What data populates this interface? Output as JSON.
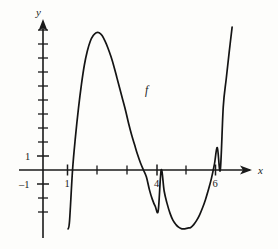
{
  "figure": {
    "background_color": "#fdfdfb",
    "curve_color": "#141414",
    "axis_color": "#1a1a1a"
  },
  "labels": {
    "y_axis_name": "y",
    "x_axis_name": "x",
    "curve_name": "f",
    "y_tick_pos_one": "1",
    "y_tick_neg_one": "–1",
    "x_tick_one": "1",
    "x_tick_four": "4",
    "x_tick_six": "6"
  },
  "chart_data": {
    "type": "line",
    "title": "",
    "xlabel": "x",
    "ylabel": "y",
    "series": [
      {
        "name": "f",
        "x": [
          0.85,
          0.9,
          1.0,
          1.1,
          1.2,
          1.3,
          1.4,
          1.5,
          1.6,
          1.7,
          1.8,
          1.9,
          2.0,
          2.1,
          2.2,
          2.3,
          2.4,
          2.5,
          2.6,
          2.7,
          2.8,
          2.9,
          3.0,
          3.1,
          3.2,
          3.3,
          3.4,
          3.5,
          3.6,
          3.7,
          3.8,
          3.9,
          4.0,
          4.1,
          4.2,
          4.3,
          4.4,
          4.5,
          4.6,
          4.7,
          4.8,
          4.9,
          5.0,
          5.1,
          5.2,
          5.3,
          5.4,
          5.5,
          5.6,
          5.7,
          5.8,
          5.9,
          6.0,
          6.1,
          6.2,
          6.3,
          6.4
        ],
        "y": [
          -4.2,
          -3.6,
          0.0,
          2.4,
          4.4,
          6.1,
          7.5,
          8.5,
          9.2,
          9.6,
          9.8,
          9.8,
          9.6,
          9.2,
          8.7,
          8.1,
          7.4,
          6.6,
          5.8,
          5.0,
          4.2,
          3.3,
          2.5,
          1.8,
          1.1,
          0.5,
          0.0,
          -0.5,
          -1.4,
          -2.1,
          -2.6,
          -2.9,
          0.0,
          -1.5,
          -2.4,
          -3.1,
          -3.6,
          -3.9,
          -4.1,
          -4.2,
          -4.2,
          -4.15,
          -4.1,
          -3.9,
          -3.6,
          -3.2,
          -2.7,
          -2.1,
          -1.4,
          -0.6,
          0.4,
          1.6,
          0.0,
          4.5,
          6.5,
          8.4,
          10.2
        ]
      }
    ],
    "roots": [
      1,
      4,
      6
    ],
    "local_maximum": {
      "x": 2.1,
      "y": 9.8
    },
    "local_minimum": {
      "x": 4.85,
      "y": -4.2
    },
    "xlim": [
      -0.45,
      7.05
    ],
    "ylim": [
      -5.5,
      10.7
    ],
    "x_ticks": [
      1,
      2,
      3,
      4,
      5,
      6
    ],
    "x_tick_labels_shown": [
      1,
      4,
      6
    ],
    "y_ticks": [
      -3,
      -2,
      -1,
      1,
      2,
      3,
      4,
      5,
      6,
      7,
      8,
      9,
      10
    ],
    "y_tick_labels_shown": [
      1,
      -1
    ],
    "grid": false,
    "legend": false,
    "annotations": [
      {
        "text": "f",
        "x": 3.55,
        "y": 5.7
      }
    ]
  }
}
